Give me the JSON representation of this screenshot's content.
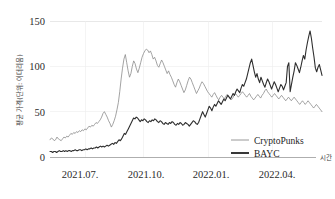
{
  "chart_data": {
    "type": "line",
    "title": "",
    "xlabel": "시간",
    "ylabel": "평균 가격(단위: 이더리움)",
    "ylim": [
      0,
      150
    ],
    "yticks": [
      0,
      50,
      100,
      150
    ],
    "ytick_labels": [
      "0",
      "50",
      "100",
      "150"
    ],
    "xtick_labels": [
      "2021.07.",
      "2021.10.",
      "2022.01.",
      "2022.04."
    ],
    "grid": true,
    "legend_position": "bottom-right",
    "x_start": "2021.06",
    "x_end": "2022.06",
    "series": [
      {
        "name": "CryptoPunks",
        "color": "#8c8c8c",
        "width": 0.8,
        "values": [
          19,
          21,
          20,
          18,
          19,
          22,
          20,
          19,
          18,
          20,
          22,
          21,
          23,
          22,
          24,
          26,
          25,
          27,
          26,
          28,
          27,
          29,
          28,
          30,
          29,
          31,
          30,
          32,
          34,
          33,
          35,
          34,
          36,
          38,
          37,
          39,
          41,
          44,
          48,
          50,
          47,
          44,
          40,
          37,
          33,
          36,
          40,
          45,
          52,
          60,
          72,
          86,
          98,
          108,
          113,
          104,
          95,
          88,
          92,
          100,
          106,
          103,
          97,
          93,
          98,
          104,
          110,
          114,
          117,
          119,
          118,
          115,
          117,
          113,
          108,
          110,
          106,
          101,
          99,
          103,
          107,
          104,
          100,
          96,
          92,
          95,
          91,
          88,
          84,
          80,
          77,
          82,
          86,
          83,
          79,
          75,
          71,
          74,
          79,
          84,
          88,
          86,
          82,
          78,
          74,
          70,
          73,
          76,
          80,
          83,
          81,
          78,
          75,
          72,
          70,
          68,
          66,
          69,
          71,
          68,
          65,
          63,
          66,
          68,
          66,
          64,
          67,
          69,
          67,
          65,
          63,
          65,
          68,
          70,
          68,
          66,
          68,
          70,
          72,
          70,
          68,
          66,
          68,
          70,
          67,
          65,
          63,
          65,
          67,
          69,
          67,
          65,
          68,
          70,
          73,
          75,
          72,
          70,
          68,
          66,
          68,
          70,
          68,
          66,
          64,
          66,
          68,
          66,
          64,
          62,
          64,
          66,
          64,
          62,
          64,
          66,
          64,
          62,
          60,
          58,
          60,
          62,
          60,
          58,
          60,
          62,
          60,
          58,
          56,
          54,
          56,
          58,
          56,
          54,
          52,
          50
        ]
      },
      {
        "name": "BAYC",
        "color": "#2e2e2e",
        "width": 1.1,
        "values": [
          6,
          6,
          5,
          6,
          6,
          5,
          6,
          7,
          6,
          6,
          7,
          6,
          7,
          6,
          7,
          7,
          6,
          7,
          7,
          8,
          7,
          7,
          8,
          8,
          7,
          8,
          8,
          9,
          8,
          9,
          9,
          10,
          9,
          10,
          10,
          11,
          10,
          11,
          12,
          11,
          12,
          11,
          12,
          13,
          12,
          13,
          14,
          15,
          14,
          16,
          15,
          17,
          19,
          18,
          20,
          23,
          26,
          25,
          28,
          31,
          34,
          37,
          40,
          43,
          42,
          44,
          43,
          41,
          39,
          41,
          40,
          42,
          41,
          39,
          38,
          40,
          39,
          41,
          40,
          42,
          41,
          39,
          38,
          40,
          39,
          37,
          36,
          38,
          37,
          36,
          38,
          37,
          39,
          38,
          36,
          35,
          37,
          36,
          38,
          37,
          35,
          36,
          38,
          37,
          36,
          34,
          36,
          38,
          40,
          39,
          37,
          36,
          38,
          42,
          46,
          50,
          47,
          44,
          48,
          52,
          56,
          54,
          51,
          55,
          58,
          56,
          59,
          62,
          60,
          58,
          61,
          64,
          62,
          65,
          68,
          66,
          64,
          67,
          70,
          68,
          72,
          75,
          73,
          71,
          76,
          80,
          78,
          82,
          86,
          92,
          98,
          104,
          108,
          101,
          94,
          88,
          92,
          86,
          82,
          88,
          84,
          80,
          77,
          82,
          86,
          83,
          79,
          75,
          79,
          83,
          80,
          76,
          72,
          76,
          80,
          78,
          74,
          78,
          82,
          100,
          104,
          72,
          80,
          88,
          95,
          104,
          101,
          97,
          93,
          99,
          106,
          112,
          108,
          118,
          126,
          133,
          139,
          131,
          120,
          110,
          98,
          94,
          99,
          102,
          96,
          90
        ]
      }
    ]
  },
  "legend": {
    "items": [
      {
        "label": "CryptoPunks",
        "color": "#8c8c8c"
      },
      {
        "label": "BAYC",
        "color": "#2e2e2e"
      }
    ]
  }
}
